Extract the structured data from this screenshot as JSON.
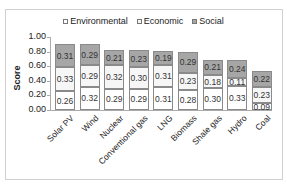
{
  "chart_data": {
    "type": "bar",
    "stacked": true,
    "title": "",
    "xlabel": "",
    "ylabel": "Score",
    "ylim": [
      0,
      1.0
    ],
    "yticks": [
      "0.00",
      "0.20",
      "0.40",
      "0.60",
      "0.80",
      "1.00"
    ],
    "legend_position": "top",
    "grid": false,
    "categories": [
      "Solar PV",
      "Wind",
      "Nuclear",
      "Conventional gas",
      "LNG",
      "Biomass",
      "Shale gas",
      "Hydro",
      "Coal"
    ],
    "series": [
      {
        "name": "Environmental",
        "color": "#ffffff",
        "values": [
          0.26,
          0.32,
          0.29,
          0.29,
          0.31,
          0.28,
          0.3,
          0.33,
          0.09
        ]
      },
      {
        "name": "Economic",
        "color": "#f6f6f6",
        "values": [
          0.33,
          0.29,
          0.32,
          0.3,
          0.31,
          0.23,
          0.18,
          0.11,
          0.23
        ]
      },
      {
        "name": "Social",
        "color": "#a6a6a6",
        "values": [
          0.31,
          0.29,
          0.21,
          0.23,
          0.19,
          0.29,
          0.21,
          0.24,
          0.22
        ]
      }
    ]
  },
  "legend": {
    "items": [
      {
        "label": "Environmental",
        "color": "#ffffff"
      },
      {
        "label": "Economic",
        "color": "#f6f6f6"
      },
      {
        "label": "Social",
        "color": "#a6a6a6"
      }
    ]
  },
  "axis": {
    "ylabel": "Score"
  }
}
